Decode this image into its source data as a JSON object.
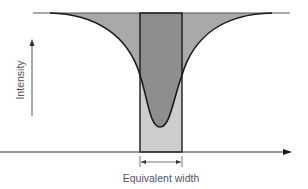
{
  "diagram": {
    "y_axis_label": "Intensity",
    "x_axis_measure_label": "Equivalent width",
    "colors": {
      "background": "#ffffff",
      "line_profile_fill": "#a9a9a9",
      "rect_above_curve_fill": "#8e8e8e",
      "rect_below_curve_fill": "#cdcdcd",
      "stroke": "#1a1a1a",
      "axis": "#333333",
      "label_text": "#555555"
    },
    "elements": {
      "continuum_line": "horizontal continuum level at top",
      "absorption_profile": "absorption line profile curve dipping to minimum",
      "equivalent_width_rectangle": "rectangle with same area as the absorption line",
      "baseline_axis": "horizontal axis with arrow pointing right",
      "intensity_axis": "vertical arrow pointing up",
      "width_indicator": "double-headed arrow spanning rectangle width"
    }
  }
}
